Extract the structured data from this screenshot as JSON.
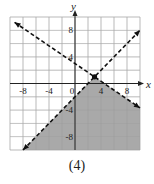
{
  "chart_data": {
    "type": "line",
    "title": "",
    "caption": "(4)",
    "xlabel": "x",
    "ylabel": "y",
    "xlim": [
      -10,
      10
    ],
    "ylim": [
      -10,
      10
    ],
    "grid": true,
    "grid_step": 2,
    "x_ticks": [
      -8,
      -4,
      0,
      4,
      8
    ],
    "x_tick_labels": [
      "-8",
      "-4",
      "0",
      "4",
      "8"
    ],
    "y_ticks": [
      8,
      4,
      -4,
      -8
    ],
    "y_tick_labels": [
      "8",
      "4",
      "-4",
      "-8"
    ],
    "series": [
      {
        "name": "boundary-line-1",
        "equation": "y = -2/3 x + 3",
        "slope": -0.6667,
        "intercept": 3,
        "style": "dashed",
        "x": [
          -9.3,
          10
        ],
        "y": [
          9.2,
          -3.67
        ]
      },
      {
        "name": "boundary-line-2",
        "equation": "y = x - 2",
        "slope": 1,
        "intercept": -2,
        "style": "dashed",
        "x": [
          -8,
          10
        ],
        "y": [
          -10,
          8
        ]
      }
    ],
    "intersection_point": {
      "x": 3,
      "y": 1
    },
    "shaded_region": "below both lines",
    "colors": {
      "shade": "#a9a9a9",
      "grid": "#c8c8c8",
      "line": "#111111"
    }
  }
}
